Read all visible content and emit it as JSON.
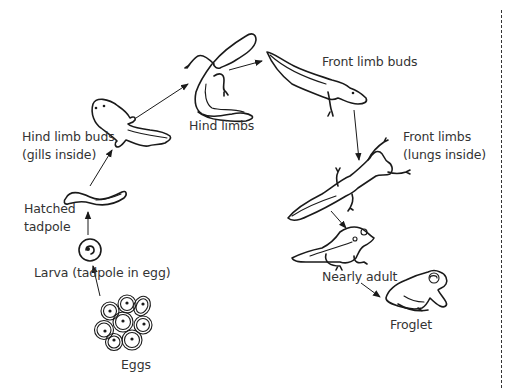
{
  "diagram": {
    "colors": {
      "ink": "#1a1a1a",
      "text": "#333333",
      "background": "#ffffff"
    },
    "stages": [
      {
        "id": "eggs",
        "label": "Eggs"
      },
      {
        "id": "larva",
        "label": "Larva (tadpole in egg)"
      },
      {
        "id": "hatched",
        "label_line1": "Hatched",
        "label_line2": "tadpole"
      },
      {
        "id": "hind-limb-buds",
        "label_line1": "Hind limb buds",
        "label_line2": "(gills inside)"
      },
      {
        "id": "hind-limbs",
        "label": "Hind limbs"
      },
      {
        "id": "front-limb-buds",
        "label": "Front limb buds"
      },
      {
        "id": "front-limbs",
        "label_line1": "Front limbs",
        "label_line2": "(lungs inside)"
      },
      {
        "id": "nearly-adult",
        "label": "Nearly adult"
      },
      {
        "id": "froglet",
        "label": "Froglet"
      }
    ],
    "arrows": [
      {
        "from": "eggs",
        "to": "larva"
      },
      {
        "from": "larva",
        "to": "hatched"
      },
      {
        "from": "hatched",
        "to": "hind-limb-buds"
      },
      {
        "from": "hind-limb-buds",
        "to": "hind-limbs"
      },
      {
        "from": "hind-limbs",
        "to": "front-limb-buds"
      },
      {
        "from": "front-limb-buds",
        "to": "front-limbs"
      },
      {
        "from": "front-limbs",
        "to": "nearly-adult"
      },
      {
        "from": "nearly-adult",
        "to": "froglet"
      }
    ]
  }
}
